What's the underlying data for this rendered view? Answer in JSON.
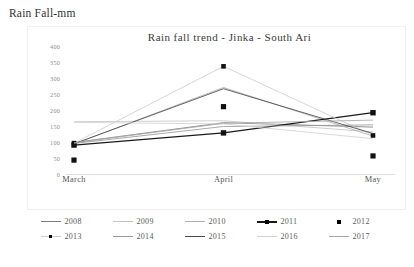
{
  "axis_label": "Rain Fall-mm",
  "chart_data": {
    "type": "line",
    "title": "Rain fall trend -  Jinka -  South Ari",
    "xlabel": "",
    "ylabel": "Rain Fall-mm",
    "categories": [
      "March",
      "April",
      "May"
    ],
    "ylim": [
      0,
      400
    ],
    "yticks": [
      400,
      350,
      300,
      250,
      200,
      150,
      100,
      50,
      0
    ],
    "grid": false,
    "legend_position": "bottom",
    "series": [
      {
        "name": "2008",
        "values": [
          100,
          162,
          148
        ],
        "color": "#7d7d7d",
        "marker": "none",
        "style": "line"
      },
      {
        "name": "2009",
        "values": [
          165,
          168,
          133
        ],
        "color": "#c6c6c6",
        "marker": "none",
        "style": "line"
      },
      {
        "name": "2010",
        "values": [
          95,
          272,
          120
        ],
        "color": "#b0b0b0",
        "marker": "none",
        "style": "line"
      },
      {
        "name": "2011",
        "values": [
          92,
          130,
          193
        ],
        "color": "#1a1a1a",
        "marker": "diamond",
        "style": "line-marker"
      },
      {
        "name": "2012",
        "values": [
          45,
          212,
          58
        ],
        "color": "#111111",
        "marker": "square",
        "style": "marker-only"
      },
      {
        "name": "2013",
        "values": [
          98,
          338,
          122
        ],
        "color": "#cfcfcf",
        "marker": "dot",
        "style": "line-marker"
      },
      {
        "name": "2014",
        "values": [
          97,
          150,
          155
        ],
        "color": "#9a9a9a",
        "marker": "none",
        "style": "line"
      },
      {
        "name": "2015",
        "values": [
          96,
          268,
          128
        ],
        "color": "#4a4a4a",
        "marker": "none",
        "style": "line"
      },
      {
        "name": "2016",
        "values": [
          163,
          158,
          112
        ],
        "color": "#d2d2d2",
        "marker": "none",
        "style": "line"
      },
      {
        "name": "2017",
        "values": [
          99,
          160,
          170
        ],
        "color": "#a8a8a8",
        "marker": "none",
        "style": "line"
      }
    ]
  }
}
